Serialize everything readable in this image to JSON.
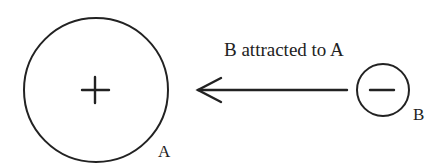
{
  "diagram": {
    "caption": "B attracted to A",
    "objects": [
      {
        "id": "A",
        "label": "A",
        "charge": "positive",
        "charge_symbol": "+",
        "center": [
          96,
          90
        ],
        "radius": 72
      },
      {
        "id": "B",
        "label": "B",
        "charge": "negative",
        "charge_symbol": "−",
        "center": [
          383,
          90
        ],
        "radius": 26
      }
    ],
    "arrow": {
      "from": "B",
      "to": "A",
      "direction": "left",
      "meaning": "attraction"
    },
    "colors": {
      "stroke": "#222222",
      "background": "#ffffff"
    }
  }
}
